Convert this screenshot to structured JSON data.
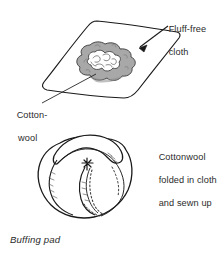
{
  "figure": {
    "caption": "Buffing pad",
    "background_color": "#ffffff",
    "ink_color": "#1a1a1a",
    "text_color": "#2b2b2b",
    "wool_fill_color": "#a8a8a8",
    "wool_core_color": "#ffffff"
  },
  "labels": {
    "fluff_free_cloth": {
      "line1": "Fluff-free",
      "line2": "cloth"
    },
    "cotton_wool": {
      "line1": "Cotton-",
      "line2": "wool"
    },
    "cottonwool_folded": {
      "line1": "Cottonwool",
      "line2": "folded in cloth",
      "line3": "and sewn up"
    }
  }
}
